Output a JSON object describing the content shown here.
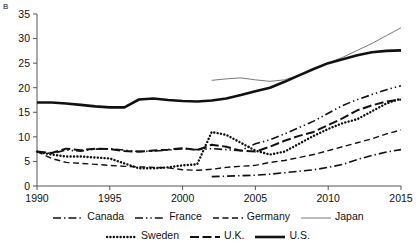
{
  "panel": {
    "label": "B"
  },
  "colors": {
    "ink": "#111111",
    "japan": "#7a7a7a",
    "axis": "#555555"
  },
  "legend": {
    "rows": [
      [
        {
          "name": "Canada",
          "style": "dash-dot"
        },
        {
          "name": "France",
          "style": "dash-dot-dot"
        },
        {
          "name": "Germany",
          "style": "dashed"
        },
        {
          "name": "Japan",
          "style": "thin-solid"
        }
      ],
      [
        {
          "name": "Sweden",
          "style": "dotted"
        },
        {
          "name": "U.K.",
          "style": "long-dash"
        },
        {
          "name": "U.S.",
          "style": "thick-solid"
        }
      ]
    ]
  },
  "chart_data": {
    "type": "line",
    "title": "",
    "subtitle": "",
    "xlabel": "",
    "ylabel": "",
    "xlim": [
      1990,
      2015
    ],
    "ylim": [
      0,
      35
    ],
    "xticks": [
      1990,
      1995,
      2000,
      2005,
      2010,
      2015
    ],
    "yticks": [
      0,
      5,
      10,
      15,
      20,
      25,
      30,
      35
    ],
    "grid": false,
    "legend_position": "bottom",
    "annotations": [
      "B"
    ],
    "series": [
      {
        "name": "U.S.",
        "style": "thick-solid",
        "x": [
          1990,
          1991,
          1992,
          1993,
          1994,
          1995,
          1996,
          1997,
          1998,
          1999,
          2000,
          2001,
          2002,
          2003,
          2004,
          2005,
          2006,
          2007,
          2008,
          2009,
          2010,
          2011,
          2012,
          2013,
          2014,
          2015
        ],
        "values": [
          17.0,
          17.0,
          16.8,
          16.5,
          16.2,
          16.0,
          16.0,
          17.6,
          17.8,
          17.5,
          17.3,
          17.2,
          17.4,
          17.8,
          18.5,
          19.3,
          20.0,
          21.2,
          22.5,
          23.8,
          25.0,
          25.8,
          26.6,
          27.2,
          27.5,
          27.6
        ]
      },
      {
        "name": "Japan",
        "style": "thin-solid",
        "x": [
          2002,
          2003,
          2004,
          2005,
          2006,
          2007,
          2008,
          2009,
          2010,
          2011,
          2012,
          2013,
          2014,
          2015
        ],
        "values": [
          21.5,
          21.8,
          22.0,
          21.6,
          21.3,
          21.6,
          22.6,
          23.8,
          25.0,
          26.2,
          27.6,
          29.0,
          30.6,
          32.2
        ]
      },
      {
        "name": "France",
        "style": "dash-dot-dot",
        "x": [
          1990,
          1991,
          1992,
          1993,
          1994,
          1995,
          1996,
          1997,
          1998,
          1999,
          2000,
          2001,
          2002,
          2003,
          2004,
          2005,
          2006,
          2007,
          2008,
          2009,
          2010,
          2011,
          2012,
          2013,
          2014,
          2015
        ],
        "values": [
          7.0,
          6.6,
          7.3,
          7.1,
          7.5,
          7.6,
          7.3,
          7.0,
          7.1,
          7.3,
          7.6,
          7.4,
          7.6,
          7.4,
          7.2,
          8.6,
          9.4,
          10.6,
          11.9,
          13.2,
          14.8,
          16.4,
          17.6,
          18.6,
          19.6,
          20.4
        ]
      },
      {
        "name": "U.K.",
        "style": "long-dash",
        "x": [
          1990,
          1991,
          1992,
          1993,
          1994,
          1995,
          1996,
          1997,
          1998,
          1999,
          2000,
          2001,
          2002,
          2003,
          2004,
          2005,
          2006,
          2007,
          2008,
          2009,
          2010,
          2011,
          2012,
          2013,
          2014,
          2015
        ],
        "values": [
          7.0,
          6.7,
          7.6,
          7.3,
          7.6,
          7.5,
          7.1,
          7.0,
          7.2,
          7.4,
          7.7,
          7.3,
          8.4,
          8.0,
          7.2,
          7.0,
          8.0,
          9.2,
          10.2,
          11.0,
          12.4,
          13.8,
          15.4,
          16.4,
          17.2,
          17.6
        ]
      },
      {
        "name": "Sweden",
        "style": "dotted",
        "x": [
          1990,
          1991,
          1992,
          1993,
          1994,
          1995,
          1996,
          1997,
          1998,
          1999,
          2000,
          2001,
          2002,
          2003,
          2004,
          2005,
          2006,
          2007,
          2008,
          2009,
          2010,
          2011,
          2012,
          2013,
          2014,
          2015
        ],
        "values": [
          7.0,
          6.4,
          6.0,
          6.0,
          5.8,
          5.6,
          4.6,
          3.6,
          3.6,
          3.8,
          4.2,
          4.4,
          11.0,
          10.4,
          8.8,
          7.2,
          6.4,
          7.0,
          8.6,
          10.2,
          11.6,
          12.8,
          13.6,
          15.2,
          16.8,
          17.8
        ]
      },
      {
        "name": "Germany",
        "style": "dashed",
        "x": [
          1990,
          1991,
          1992,
          1993,
          1994,
          1995,
          1996,
          1997,
          1998,
          1999,
          2000,
          2001,
          2002,
          2003,
          2004,
          2005,
          2006,
          2007,
          2008,
          2009,
          2010,
          2011,
          2012,
          2013,
          2014,
          2015
        ],
        "values": [
          7.0,
          5.6,
          4.8,
          4.6,
          4.4,
          4.2,
          4.0,
          3.9,
          3.8,
          3.7,
          3.3,
          3.2,
          3.4,
          3.8,
          4.0,
          4.2,
          4.8,
          5.2,
          5.8,
          6.4,
          7.2,
          8.0,
          8.8,
          9.6,
          10.6,
          11.4
        ]
      },
      {
        "name": "Canada",
        "style": "dash-dot",
        "x": [
          2002,
          2003,
          2004,
          2005,
          2006,
          2007,
          2008,
          2009,
          2010,
          2011,
          2012,
          2013,
          2014,
          2015
        ],
        "values": [
          1.9,
          2.0,
          2.1,
          2.2,
          2.4,
          2.7,
          3.0,
          3.3,
          3.8,
          4.4,
          5.4,
          6.2,
          6.9,
          7.4
        ]
      }
    ]
  }
}
